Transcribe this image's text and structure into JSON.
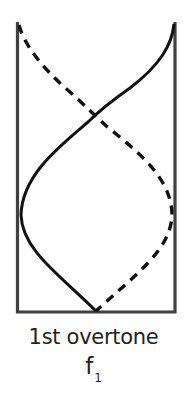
{
  "diagram": {
    "title": "1st overtone",
    "symbol": "f",
    "symbol_subscript": "1",
    "tube": {
      "left_x": 17,
      "right_x": 175,
      "top_y": 23,
      "bottom_y": 312,
      "open_end": "top",
      "closed_end": "bottom",
      "wall_color": "#404040"
    },
    "waves": [
      {
        "name": "displacement-solid",
        "style": "solid",
        "color": "#111111",
        "start": [
          175,
          24
        ],
        "node_crossing": [
          96,
          118
        ],
        "antinode_extreme": [
          21,
          215
        ],
        "end": [
          96,
          311
        ]
      },
      {
        "name": "displacement-dashed",
        "style": "dashed",
        "color": "#111111",
        "start": [
          19,
          27
        ],
        "node_crossing": [
          96,
          118
        ],
        "antinode_extreme": [
          172,
          215
        ],
        "end": [
          96,
          311
        ]
      }
    ]
  }
}
